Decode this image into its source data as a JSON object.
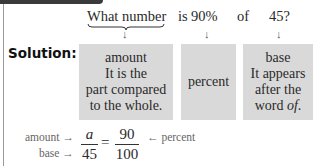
{
  "question": {
    "parts": [
      "What number",
      "is",
      "90%",
      "of",
      "45?"
    ]
  },
  "solution_label": "Solution:",
  "boxes": [
    {
      "lines": [
        "amount",
        "It is the",
        "part compared",
        "to the whole."
      ]
    },
    {
      "lines": [
        "percent"
      ]
    },
    {
      "lines": [
        "base",
        "It appears",
        "after the",
        "word "
      ],
      "italic_tail": "of",
      "tail_end": "."
    }
  ],
  "proportion": {
    "left_label_top": "amount",
    "left_label_bottom": "base",
    "numerator_left": "a",
    "denominator_left": "45",
    "equals": "=",
    "numerator_right": "90",
    "denominator_right": "100",
    "right_label": "percent",
    "arrow_right": "→",
    "arrow_left": "←"
  },
  "down_arrow": "↓"
}
